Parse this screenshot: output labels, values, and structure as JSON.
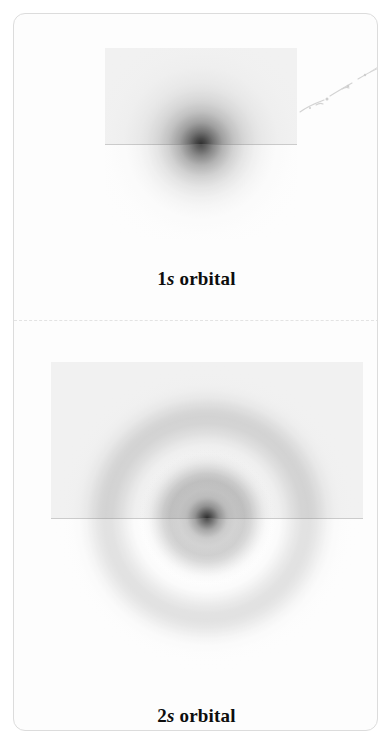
{
  "figure": {
    "type": "atomic-orbital-electron-density",
    "background_color": "#fdfdfd",
    "border_color": "#dcdcdc",
    "divider_style": "dashed",
    "divider_color": "#e3e3e3"
  },
  "panels": [
    {
      "id": "1s",
      "label_prefix": "1",
      "label_shell": "s",
      "label_suffix": " orbital",
      "label_full": "1s orbital",
      "description": "spherical electron density cloud with a single dense central maximum and no radial node",
      "nodes": 0,
      "cut_plane": "horizontal",
      "center_x": 196,
      "center_y": 152,
      "extent_px": 192
    },
    {
      "id": "2s",
      "label_prefix": "2",
      "label_shell": "s",
      "label_suffix": " orbital",
      "label_full": "2s orbital",
      "description": "spherical electron density cloud with a dense compact core, one radial node, and a broad outer shell",
      "nodes": 1,
      "cut_plane": "horizontal",
      "center_x": 203,
      "center_y": 512,
      "extent_px": 312
    }
  ],
  "annotations": {
    "scan_smudge": "faint diagonal scan artifact in upper-right of the 1s panel"
  }
}
